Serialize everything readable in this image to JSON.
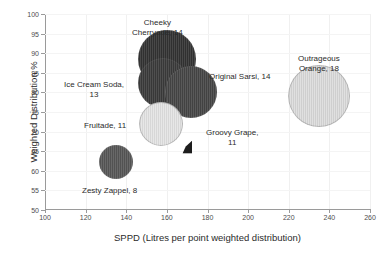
{
  "chart_data": {
    "type": "scatter",
    "subtype": "bubble",
    "title": "",
    "xlabel": "SPPD (Litres per point weighted distribution)",
    "ylabel": "Weighted Distribution %",
    "xlim": [
      100,
      260
    ],
    "ylim": [
      50,
      100
    ],
    "xticks": [
      100,
      120,
      140,
      160,
      180,
      200,
      220,
      240,
      260
    ],
    "yticks": [
      50,
      55,
      60,
      65,
      70,
      75,
      80,
      85,
      90,
      95,
      100
    ],
    "grid": true,
    "legend": "none",
    "points": [
      {
        "name": "Cheeky Cherryade",
        "x": 160,
        "y": 88.5,
        "size": 14,
        "radius_px": 29,
        "color": "#333333",
        "label_text": "Cheeky\nCherryade, 14",
        "label_x": 132,
        "label_y": 18
      },
      {
        "name": "Ice Cream Soda",
        "x": 158,
        "y": 82.5,
        "size": 13,
        "radius_px": 25,
        "color": "#3b3b3b",
        "label_text": "Ice Cream Soda,\n13",
        "label_x": 64,
        "label_y": 80
      },
      {
        "name": "Original Sarsi",
        "x": 172,
        "y": 80,
        "size": 14,
        "radius_px": 26,
        "color": "#464646",
        "label_text": "Original Sarsi, 14",
        "label_x": 209,
        "label_y": 72
      },
      {
        "name": "Fruitade",
        "x": 157,
        "y": 72,
        "size": 11,
        "radius_px": 22,
        "color": "#e4e4e4",
        "label_text": "Fruitade, 11",
        "label_x": 84,
        "label_y": 121
      },
      {
        "name": "Groovy Grape",
        "x": 170,
        "y": 66,
        "size": 11,
        "radius_px": 6,
        "color": "#1d1d1d",
        "label_text": "Groovy Grape,\n11",
        "label_x": 206,
        "label_y": 128
      },
      {
        "name": "Zesty Zappel",
        "x": 135,
        "y": 62.2,
        "size": 8,
        "radius_px": 17,
        "color": "#575757",
        "label_text": "Zesty Zappel, 8",
        "label_x": 82,
        "label_y": 186
      },
      {
        "name": "Outrageous Orange",
        "x": 235,
        "y": 79,
        "size": 18,
        "radius_px": 31,
        "color": "#dcdcdc",
        "label_text": "Outrageous\nOrange, 18",
        "label_x": 298,
        "label_y": 54
      }
    ]
  },
  "colors": {
    "axis": "#9a9a9a",
    "grid": "#f0f0f0",
    "text": "#2b2b2b",
    "tick_text": "#4d4d4d",
    "background": "#ffffff"
  }
}
